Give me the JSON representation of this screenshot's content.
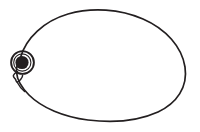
{
  "figure": {
    "description": "Simple black ink contour drawing on a plain white background: a large egg-shaped body outline with a round eye and a small pointed beak at the left side.",
    "canvas": {
      "width": 200,
      "height": 132,
      "background_color": "#ffffff"
    },
    "ink_color": "#231f20",
    "parts": [
      {
        "name": "body-outline",
        "label": "Body outline",
        "shape": "closed egg / oval contour",
        "stroke_width": 1.6,
        "filled": false,
        "bounds": {
          "x": 11,
          "y": 10,
          "width": 175,
          "height": 112
        }
      },
      {
        "name": "eye-outer-ring",
        "label": "Eye outer ring",
        "shape": "circle",
        "stroke_width": 1.8,
        "filled": false,
        "center": {
          "x": 22.5,
          "y": 62.5
        },
        "radius": 11.5
      },
      {
        "name": "eye-pupil",
        "label": "Eye pupil",
        "shape": "filled circle",
        "filled": true,
        "fill_color": "#231f20",
        "center": {
          "x": 22.0,
          "y": 62.5
        },
        "radius": 6.6
      },
      {
        "name": "beak",
        "label": "Beak",
        "shape": "small angular nub",
        "stroke_width": 1.5,
        "filled": false,
        "bounds": {
          "x": 13,
          "y": 71,
          "width": 10,
          "height": 11
        }
      }
    ]
  }
}
